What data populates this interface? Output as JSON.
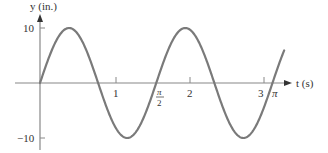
{
  "chart_data": {
    "type": "line",
    "title": "",
    "xlabel": "t (s)",
    "ylabel": "y (in.)",
    "equation_implied": "y = 10 sin(4t)",
    "x_ticks": [
      {
        "value": 1,
        "label": "1"
      },
      {
        "value": 1.5708,
        "label": "π/2"
      },
      {
        "value": 2,
        "label": "2"
      },
      {
        "value": 3,
        "label": "3"
      },
      {
        "value": 3.1416,
        "label": "π"
      }
    ],
    "y_ticks": [
      {
        "value": 10,
        "label": "10"
      },
      {
        "value": -10,
        "label": "-10"
      }
    ],
    "xlim": [
      0,
      3.3
    ],
    "ylim": [
      -10,
      10
    ],
    "grid": false,
    "legend": null,
    "series": [
      {
        "name": "y(t)",
        "amplitude": 10,
        "angular_frequency": 4,
        "period": 1.5708,
        "x": [
          0,
          0.3927,
          0.7854,
          1.1781,
          1.5708,
          1.9635,
          2.3562,
          2.7489,
          3.1416,
          3.3
        ],
        "values": [
          0,
          10,
          0,
          -10,
          0,
          10,
          0,
          -10,
          0,
          6.1
        ]
      }
    ]
  },
  "labels": {
    "y_axis": "y (in.)",
    "x_axis": "t (s)",
    "y_top": "10",
    "y_bottom": "−10",
    "x_1": "1",
    "x_pi2_num": "π",
    "x_pi2_den": "2",
    "x_2": "2",
    "x_3": "3",
    "x_pi": "π"
  },
  "colors": {
    "curve": "#7a7a7a",
    "axis": "#888888",
    "text": "#333333"
  }
}
